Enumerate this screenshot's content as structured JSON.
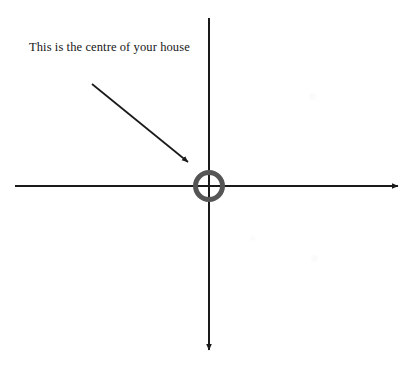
{
  "page": {
    "background_color": "#ffffff",
    "width": 418,
    "height": 368
  },
  "annotation": {
    "label_text": "This is the centre of your house",
    "text_color": "#171717",
    "pointer_color": "#1a1a1a",
    "pointer_from": {
      "x": 92,
      "y": 84
    },
    "pointer_to": {
      "x": 192,
      "y": 166
    }
  },
  "axes": {
    "color": "#1a1a1a",
    "stroke_width": 2,
    "origin": {
      "x": 209,
      "y": 186
    },
    "horizontal": {
      "name": "horizontal-axis",
      "from": {
        "x": 15,
        "y": 186
      },
      "to": {
        "x": 402,
        "y": 186
      },
      "arrowhead": "right"
    },
    "vertical": {
      "name": "vertical-axis",
      "from": {
        "x": 209,
        "y": 18
      },
      "to": {
        "x": 209,
        "y": 354
      },
      "arrowhead": "down"
    }
  },
  "centre_marker": {
    "label": "centre-of-house-ring",
    "shape": "ring",
    "center": {
      "x": 209,
      "y": 186
    },
    "outer_diameter": 32,
    "stroke_width": 5,
    "color": "#555555"
  },
  "artifacts": [
    {
      "x": 312,
      "y": 96,
      "size": 7
    },
    {
      "x": 252,
      "y": 238,
      "size": 5
    },
    {
      "x": 314,
      "y": 258,
      "size": 7
    }
  ]
}
